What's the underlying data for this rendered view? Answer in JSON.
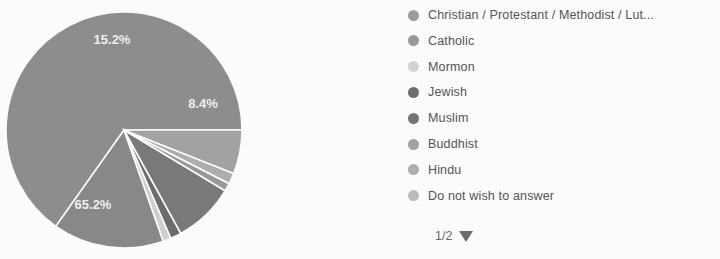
{
  "chart_data": {
    "type": "pie",
    "title": "",
    "legend_position": "right",
    "categories": [
      "Christian / Protestant / Methodist / Lut...",
      "Catholic",
      "Mormon",
      "Jewish",
      "Muslim",
      "Buddhist",
      "Hindu",
      "Do not wish to answer"
    ],
    "values": [
      65.2,
      15.2,
      1.1,
      1.5,
      8.4,
      1.1,
      1.5,
      6.0
    ],
    "value_unit": "%",
    "visible_labels": [
      "65.2%",
      "15.2%",
      "8.4%"
    ],
    "slices": [
      {
        "label": "Christian / Protestant / Methodist / Lut...",
        "value": 65.2,
        "display": "65.2%",
        "color": "#8f8f8f",
        "label_visible": true
      },
      {
        "label": "Catholic",
        "value": 15.2,
        "display": "15.2%",
        "color": "#8a8a8a",
        "label_visible": true
      },
      {
        "label": "Mormon",
        "value": 1.1,
        "display": "1.1%",
        "color": "#d2d2d2",
        "label_visible": false
      },
      {
        "label": "Jewish",
        "value": 1.5,
        "display": "1.5%",
        "color": "#6e6e6e",
        "label_visible": false
      },
      {
        "label": "Muslim",
        "value": 8.4,
        "display": "8.4%",
        "color": "#7b7b7b",
        "label_visible": true
      },
      {
        "label": "Buddhist",
        "value": 1.1,
        "display": "1.1%",
        "color": "#9a9a9a",
        "label_visible": false
      },
      {
        "label": "Hindu",
        "value": 1.5,
        "display": "1.5%",
        "color": "#b0b0b0",
        "label_visible": false
      },
      {
        "label": "Do not wish to answer",
        "value": 6.0,
        "display": "6.0%",
        "color": "#a5a5a5",
        "label_visible": false
      }
    ],
    "data_labels": [
      {
        "text": "15.2%",
        "x": 112,
        "y": 44
      },
      {
        "text": "8.4%",
        "x": 203,
        "y": 108
      },
      {
        "text": "65.2%",
        "x": 93,
        "y": 209
      }
    ]
  },
  "legend": {
    "items": [
      {
        "label": "Christian / Protestant / Methodist / Lut...",
        "color": "#9e9e9e",
        "truncated": true
      },
      {
        "label": "Catholic",
        "color": "#9a9a9a",
        "truncated": false
      },
      {
        "label": "Mormon",
        "color": "#d6d6d6",
        "truncated": false
      },
      {
        "label": "Jewish",
        "color": "#707070",
        "truncated": false
      },
      {
        "label": "Muslim",
        "color": "#767676",
        "truncated": false
      },
      {
        "label": "Buddhist",
        "color": "#a3a3a3",
        "truncated": false
      },
      {
        "label": "Hindu",
        "color": "#afafaf",
        "truncated": false
      },
      {
        "label": "Do not wish to answer",
        "color": "#bdbdbd",
        "truncated": false
      }
    ]
  },
  "pager": {
    "label": "1/2",
    "current_page": 1,
    "total_pages": 2,
    "next_icon": "triangle-down-icon"
  },
  "colors": {
    "background": "#ffffff",
    "legend_text": "#565656",
    "slice_label_text": "#f2f2f2",
    "pager_text": "#6a6a6a"
  }
}
